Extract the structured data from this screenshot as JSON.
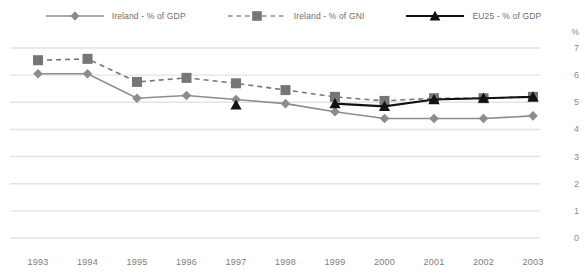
{
  "chart_data": {
    "type": "line",
    "title": "",
    "subtitle": "",
    "xlabel": "",
    "ylabel": "",
    "y_unit_label": "%",
    "x": [
      "1993",
      "1994",
      "1995",
      "1996",
      "1997",
      "1998",
      "1999",
      "2000",
      "2001",
      "2002",
      "2003"
    ],
    "categories": [
      "1993",
      "1994",
      "1995",
      "1996",
      "1997",
      "1998",
      "1999",
      "2000",
      "2001",
      "2002",
      "2003"
    ],
    "ylim": [
      0,
      7
    ],
    "yticks": [
      "0",
      "1",
      "2",
      "3",
      "4",
      "5",
      "6",
      "7"
    ],
    "grid": true,
    "legend_position": "top-center",
    "series": [
      {
        "name": "Ireland - % of GDP",
        "marker": "diamond",
        "line_style": "solid",
        "color": "#8c8c8c",
        "values": [
          6.05,
          6.05,
          5.15,
          5.25,
          5.1,
          4.95,
          4.65,
          4.4,
          4.4,
          4.4,
          4.5
        ]
      },
      {
        "name": "Ireland - % of GNI",
        "marker": "square",
        "line_style": "dashed",
        "color": "#767676",
        "values": [
          6.55,
          6.6,
          5.75,
          5.9,
          5.7,
          5.45,
          5.2,
          5.05,
          5.15,
          5.15,
          5.2
        ]
      },
      {
        "name": "EU25 - % of GDP",
        "marker": "triangle",
        "line_style": "solid",
        "color": "#111111",
        "values": [
          null,
          null,
          null,
          null,
          4.9,
          null,
          4.95,
          4.85,
          5.1,
          5.15,
          5.2
        ]
      }
    ]
  },
  "legend": {
    "items": [
      {
        "label": "Ireland - % of GDP",
        "icon": "diamond-marker-icon"
      },
      {
        "label": "Ireland - % of GNI",
        "icon": "square-marker-icon"
      },
      {
        "label": "EU25 - % of GDP",
        "icon": "triangle-marker-icon"
      }
    ]
  }
}
